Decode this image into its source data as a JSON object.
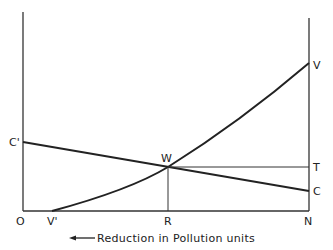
{
  "diagram": {
    "type": "economics-pollution-abatement",
    "x_axis_caption": "Reduction in Pollution units",
    "caption_arrow": "left",
    "axis_labels": {
      "origin": "O",
      "right_origin": "N",
      "intersection_foot": "R",
      "v_prime": "V'"
    },
    "point_labels": {
      "c_prime": "C'",
      "c": "C",
      "w": "W",
      "t": "T",
      "v": "V"
    },
    "curves": [
      {
        "name": "cost-curve",
        "from": "C'",
        "to": "C",
        "shape": "straight-line-declining"
      },
      {
        "name": "value-curve",
        "from": "V'",
        "to": "V",
        "shape": "convex-rising"
      },
      {
        "name": "wt-line",
        "from": "W",
        "to": "T",
        "shape": "horizontal"
      },
      {
        "name": "wr-line",
        "from": "W",
        "to": "R",
        "shape": "vertical"
      }
    ],
    "colors": {
      "line": "#222222",
      "background": "#ffffff"
    }
  }
}
